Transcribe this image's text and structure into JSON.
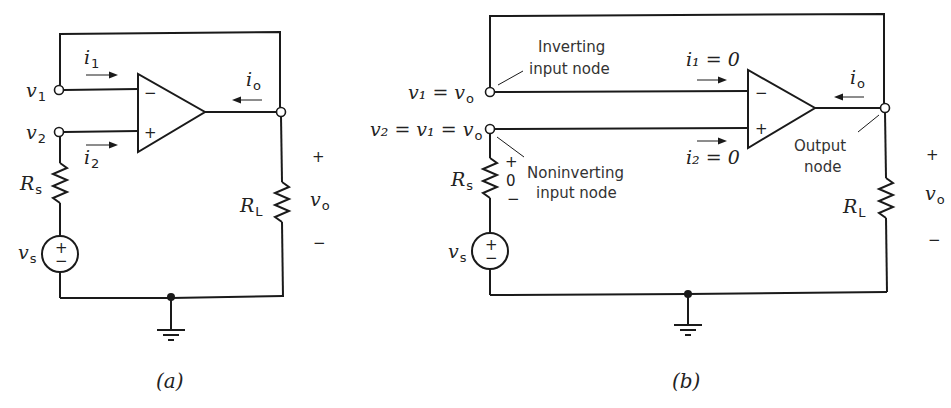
{
  "figure_a": {
    "caption": "(a)",
    "labels": {
      "v1": "v",
      "v1_sub": "1",
      "v2": "v",
      "v2_sub": "2",
      "i1": "i",
      "i1_sub": "1",
      "i2": "i",
      "i2_sub": "2",
      "io": "i",
      "io_sub": "o",
      "Rs": "R",
      "Rs_sub": "s",
      "RL": "R",
      "RL_sub": "L",
      "vs": "v",
      "vs_sub": "s",
      "vo": "v",
      "vo_sub": "o",
      "vo_plus": "+",
      "vo_minus": "−",
      "opamp_minus": "−",
      "opamp_plus": "+",
      "source_plus": "+",
      "source_minus": "−"
    }
  },
  "figure_b": {
    "caption": "(b)",
    "labels": {
      "v1_eq": "v₁ = v",
      "v1_eq_sub": "o",
      "v2_eq": "v₂ = v₁ = v",
      "v2_eq_sub": "o",
      "i1_eq": "i₁ = 0",
      "i2_eq": "i₂ = 0",
      "io": "i",
      "io_sub": "o",
      "Rs": "R",
      "Rs_sub": "s",
      "RL": "R",
      "RL_sub": "L",
      "vs": "v",
      "vs_sub": "s",
      "vo": "v",
      "vo_sub": "o",
      "vo_plus": "+",
      "vo_minus": "−",
      "rs_plus": "+",
      "rs_zero": "0",
      "rs_minus": "−",
      "opamp_minus": "−",
      "opamp_plus": "+",
      "source_plus": "+",
      "source_minus": "−"
    },
    "annotations": {
      "inverting_line1": "Inverting",
      "inverting_line2": "input node",
      "noninverting_line1": "Noninverting",
      "noninverting_line2": "input node",
      "output_line1": "Output",
      "output_line2": "node"
    }
  }
}
